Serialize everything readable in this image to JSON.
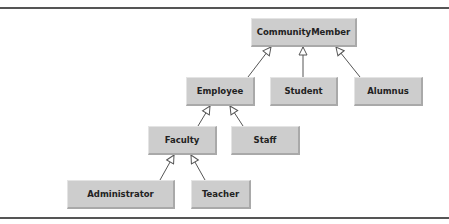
{
  "diagram": {
    "type": "uml-class-hierarchy",
    "nodes": [
      {
        "id": "communitymember",
        "label": "CommunityMember"
      },
      {
        "id": "employee",
        "label": "Employee"
      },
      {
        "id": "student",
        "label": "Student"
      },
      {
        "id": "alumnus",
        "label": "Alumnus"
      },
      {
        "id": "faculty",
        "label": "Faculty"
      },
      {
        "id": "staff",
        "label": "Staff"
      },
      {
        "id": "administrator",
        "label": "Administrator"
      },
      {
        "id": "teacher",
        "label": "Teacher"
      }
    ],
    "edges": [
      {
        "from": "employee",
        "to": "communitymember",
        "kind": "inheritance"
      },
      {
        "from": "student",
        "to": "communitymember",
        "kind": "inheritance"
      },
      {
        "from": "alumnus",
        "to": "communitymember",
        "kind": "inheritance"
      },
      {
        "from": "faculty",
        "to": "employee",
        "kind": "inheritance"
      },
      {
        "from": "staff",
        "to": "employee",
        "kind": "inheritance"
      },
      {
        "from": "administrator",
        "to": "faculty",
        "kind": "inheritance"
      },
      {
        "from": "teacher",
        "to": "faculty",
        "kind": "inheritance"
      }
    ],
    "colors": {
      "node_fill": "#cdcdcd",
      "line": "#555555",
      "text": "#222222"
    }
  }
}
